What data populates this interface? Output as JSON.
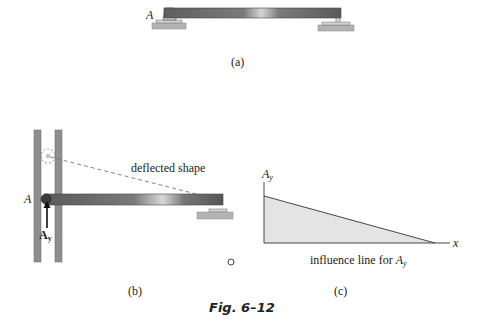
{
  "figure": {
    "caption": "Fig. 6–12",
    "panels": {
      "a": {
        "label": "(a)",
        "support_label": "A",
        "description": "simply supported beam with pin at A and roller at right end"
      },
      "b": {
        "label": "(b)",
        "support_label": "A",
        "reaction_label": "A",
        "reaction_subscript": "y",
        "annotation": "deflected shape"
      },
      "c": {
        "label": "(c)",
        "y_axis_label": "A",
        "y_axis_subscript": "y",
        "x_axis_label": "x",
        "caption_prefix": "influence line for ",
        "caption_var": "A",
        "caption_sub": "y"
      }
    }
  },
  "colors": {
    "beam": "#6e6e6e",
    "beam_highlight": "#d8d8d8",
    "ground": "#b0b0b0",
    "guide": "#8a8a8a",
    "influence_fill": "#e6e6e6",
    "line": "#333333"
  }
}
